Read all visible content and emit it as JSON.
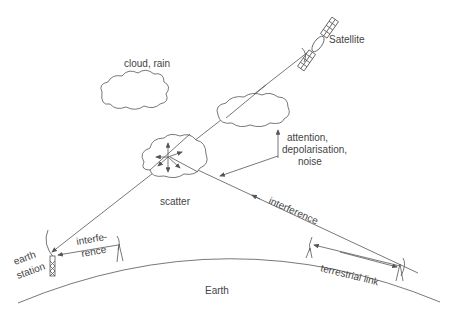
{
  "diagram": {
    "labels": {
      "satellite": "Satellite",
      "cloud_rain": "cloud, rain",
      "attention_line1": "attention,",
      "attention_line2": "depolarisation,",
      "attention_line3": "noise",
      "scatter": "scatter",
      "interference_long": "interference",
      "interference_short_1": "interfe-",
      "interference_short_2": "rence",
      "earth_station_1": "earth",
      "earth_station_2": "station",
      "earth": "Earth",
      "terrestrial_link": "terrestrial link"
    },
    "colors": {
      "line": "#555555",
      "text": "#444444",
      "background": "#ffffff"
    }
  }
}
